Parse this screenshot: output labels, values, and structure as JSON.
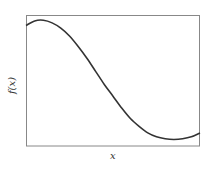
{
  "chart_data": {
    "type": "line",
    "title": "",
    "xlabel": "x",
    "ylabel": "f(x)",
    "grid": false,
    "legend": null,
    "xticks": [],
    "yticks": [],
    "xlim": [
      0,
      1
    ],
    "ylim": [
      0,
      1
    ],
    "series": [
      {
        "name": "f(x)",
        "color": "#333333",
        "x": [
          0.0,
          0.05,
          0.1,
          0.15,
          0.2,
          0.25,
          0.3,
          0.35,
          0.4,
          0.45,
          0.5,
          0.55,
          0.6,
          0.65,
          0.7,
          0.75,
          0.8,
          0.85,
          0.9,
          0.95,
          1.0
        ],
        "y": [
          0.92,
          0.955,
          0.96,
          0.94,
          0.9,
          0.84,
          0.76,
          0.67,
          0.57,
          0.47,
          0.38,
          0.29,
          0.21,
          0.15,
          0.1,
          0.07,
          0.055,
          0.05,
          0.055,
          0.07,
          0.1
        ]
      }
    ]
  },
  "frame": {
    "left": 26,
    "top": 15,
    "right": 200,
    "bottom": 146,
    "stroke": "#888888"
  }
}
